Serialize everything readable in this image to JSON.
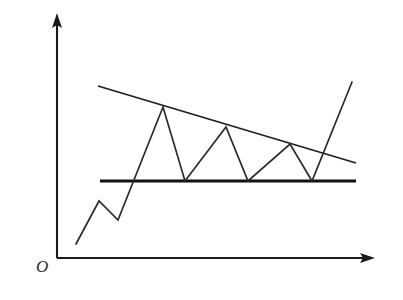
{
  "figure": {
    "domain": "diagram",
    "kind": "stock-chart-pattern-sketch",
    "background_color": "#ffffff",
    "line_color": "#1a1a1a",
    "width": 403,
    "height": 300
  },
  "axes": {
    "origin_label": "O",
    "origin_label_position": {
      "x": 36,
      "y": 258
    },
    "y_axis": {
      "name": "vertical-axis",
      "x": 57,
      "y_top": 20,
      "y_bottom": 258,
      "arrow": "up",
      "tick_labels": []
    },
    "x_axis": {
      "name": "horizontal-axis",
      "y": 258,
      "x_left": 57,
      "x_right": 368,
      "arrow": "right",
      "tick_labels": []
    }
  },
  "chart_data": {
    "type": "line",
    "title": "",
    "subtitle": "",
    "xlabel": "",
    "ylabel": "",
    "pattern_name": "descending triangle",
    "grid": false,
    "legend": null,
    "axis_tick_labels": {
      "x": [],
      "y": []
    },
    "xlim": [
      57,
      375
    ],
    "ylim": [
      258,
      13
    ],
    "series": [
      {
        "name": "price-path",
        "type": "line",
        "points": [
          {
            "x": 76,
            "y": 244,
            "role": "start"
          },
          {
            "x": 99,
            "y": 201,
            "role": "minor-peak"
          },
          {
            "x": 118,
            "y": 220,
            "role": "minor-trough"
          },
          {
            "x": 163,
            "y": 107,
            "role": "peak-1-resistance-touch"
          },
          {
            "x": 185,
            "y": 181,
            "role": "trough-1-support-touch"
          },
          {
            "x": 226,
            "y": 127,
            "role": "peak-2-resistance-touch"
          },
          {
            "x": 248,
            "y": 181,
            "role": "trough-2-support-touch"
          },
          {
            "x": 290,
            "y": 144,
            "role": "peak-3-resistance-touch"
          },
          {
            "x": 312,
            "y": 181,
            "role": "trough-3-support-touch"
          },
          {
            "x": 352,
            "y": 82,
            "role": "breakout-end"
          }
        ]
      }
    ],
    "trend_lines": [
      {
        "name": "resistance-line",
        "style": "descending",
        "x1": 98,
        "y1": 86,
        "x2": 356,
        "y2": 163
      },
      {
        "name": "support-line",
        "style": "horizontal",
        "x1": 100,
        "y1": 181,
        "x2": 356,
        "y2": 181
      }
    ],
    "annotations": [
      {
        "name": "origin",
        "text": "O",
        "x": 36,
        "y": 258
      }
    ]
  }
}
